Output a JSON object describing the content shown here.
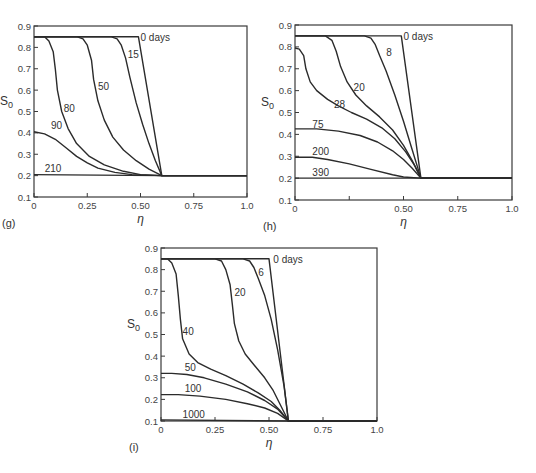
{
  "figure": {
    "panels": [
      "g",
      "h",
      "i"
    ]
  },
  "chart_data": [
    {
      "type": "line",
      "panel_label": "(g)",
      "title": "",
      "xlabel": "η",
      "ylabel": "S0",
      "xlim": [
        0,
        1.0
      ],
      "ylim": [
        0.1,
        0.9
      ],
      "x_ticks": [
        "0",
        "0.25",
        "0.50",
        "0.75",
        "1.0"
      ],
      "y_ticks": [
        "0.1",
        "0.2",
        "0.3",
        "0.4",
        "0.5",
        "0.6",
        "0.7",
        "0.8",
        "0.9"
      ],
      "grid": false,
      "legend": "inline curve labels",
      "box_px": {
        "x0": 34,
        "x1": 247,
        "y_top": 26,
        "y_bot": 197
      },
      "series": [
        {
          "name": "0 days",
          "label_at": [
            0.5,
            0.83
          ],
          "points": [
            [
              0,
              0.85
            ],
            [
              0.49,
              0.85
            ],
            [
              0.6,
              0.2
            ],
            [
              1.0,
              0.2
            ]
          ]
        },
        {
          "name": "15",
          "label_at": [
            0.44,
            0.75
          ],
          "points": [
            [
              0,
              0.85
            ],
            [
              0.36,
              0.85
            ],
            [
              0.39,
              0.84
            ],
            [
              0.41,
              0.81
            ],
            [
              0.43,
              0.75
            ],
            [
              0.45,
              0.66
            ],
            [
              0.48,
              0.54
            ],
            [
              0.51,
              0.44
            ],
            [
              0.54,
              0.35
            ],
            [
              0.57,
              0.27
            ],
            [
              0.6,
              0.2
            ],
            [
              1.0,
              0.2
            ]
          ]
        },
        {
          "name": "50",
          "label_at": [
            0.3,
            0.6
          ],
          "points": [
            [
              0,
              0.85
            ],
            [
              0.2,
              0.85
            ],
            [
              0.23,
              0.84
            ],
            [
              0.25,
              0.81
            ],
            [
              0.27,
              0.74
            ],
            [
              0.28,
              0.65
            ],
            [
              0.3,
              0.55
            ],
            [
              0.33,
              0.46
            ],
            [
              0.37,
              0.38
            ],
            [
              0.42,
              0.32
            ],
            [
              0.48,
              0.27
            ],
            [
              0.54,
              0.23
            ],
            [
              0.6,
              0.2
            ],
            [
              1.0,
              0.2
            ]
          ]
        },
        {
          "name": "80",
          "label_at": [
            0.14,
            0.5
          ],
          "points": [
            [
              0,
              0.85
            ],
            [
              0.05,
              0.85
            ],
            [
              0.07,
              0.83
            ],
            [
              0.09,
              0.78
            ],
            [
              0.1,
              0.7
            ],
            [
              0.11,
              0.6
            ],
            [
              0.13,
              0.5
            ],
            [
              0.16,
              0.42
            ],
            [
              0.2,
              0.35
            ],
            [
              0.26,
              0.29
            ],
            [
              0.33,
              0.25
            ],
            [
              0.42,
              0.22
            ],
            [
              0.5,
              0.205
            ],
            [
              0.6,
              0.2
            ],
            [
              1.0,
              0.2
            ]
          ]
        },
        {
          "name": "90",
          "label_at": [
            0.08,
            0.42
          ],
          "points": [
            [
              0,
              0.405
            ],
            [
              0.05,
              0.395
            ],
            [
              0.1,
              0.37
            ],
            [
              0.15,
              0.33
            ],
            [
              0.2,
              0.29
            ],
            [
              0.25,
              0.26
            ],
            [
              0.3,
              0.235
            ],
            [
              0.38,
              0.215
            ],
            [
              0.46,
              0.205
            ],
            [
              0.6,
              0.2
            ],
            [
              1.0,
              0.2
            ]
          ]
        },
        {
          "name": "210",
          "label_at": [
            0.05,
            0.215
          ],
          "points": [
            [
              0,
              0.205
            ],
            [
              0.6,
              0.2
            ],
            [
              1.0,
              0.2
            ]
          ]
        }
      ]
    },
    {
      "type": "line",
      "panel_label": "(h)",
      "title": "",
      "xlabel": "η",
      "ylabel": "S0",
      "xlim": [
        0,
        1.0
      ],
      "ylim": [
        0.1,
        0.9
      ],
      "x_ticks": [
        "0",
        "",
        "0.50",
        "0.75",
        "1.0"
      ],
      "y_ticks": [
        "0.1",
        "0.2",
        "0.3",
        "0.4",
        "0.5",
        "0.6",
        "0.7",
        "0.8",
        "0.9"
      ],
      "grid": false,
      "legend": "inline curve labels",
      "box_px": {
        "x0": 295,
        "x1": 512,
        "y_top": 25,
        "y_bot": 200
      },
      "series": [
        {
          "name": "0 days",
          "label_at": [
            0.5,
            0.83
          ],
          "points": [
            [
              0,
              0.85
            ],
            [
              0.49,
              0.85
            ],
            [
              0.58,
              0.2
            ],
            [
              1.0,
              0.2
            ]
          ]
        },
        {
          "name": "8",
          "label_at": [
            0.42,
            0.76
          ],
          "points": [
            [
              0,
              0.85
            ],
            [
              0.32,
              0.85
            ],
            [
              0.35,
              0.84
            ],
            [
              0.37,
              0.81
            ],
            [
              0.39,
              0.76
            ],
            [
              0.42,
              0.69
            ],
            [
              0.46,
              0.58
            ],
            [
              0.5,
              0.46
            ],
            [
              0.54,
              0.33
            ],
            [
              0.58,
              0.2
            ],
            [
              1.0,
              0.2
            ]
          ]
        },
        {
          "name": "20",
          "label_at": [
            0.27,
            0.6
          ],
          "points": [
            [
              0,
              0.85
            ],
            [
              0.14,
              0.85
            ],
            [
              0.17,
              0.83
            ],
            [
              0.19,
              0.78
            ],
            [
              0.21,
              0.71
            ],
            [
              0.24,
              0.64
            ],
            [
              0.28,
              0.58
            ],
            [
              0.33,
              0.53
            ],
            [
              0.39,
              0.48
            ],
            [
              0.45,
              0.42
            ],
            [
              0.5,
              0.35
            ],
            [
              0.54,
              0.28
            ],
            [
              0.58,
              0.2
            ],
            [
              1.0,
              0.2
            ]
          ]
        },
        {
          "name": "28",
          "label_at": [
            0.18,
            0.52
          ],
          "points": [
            [
              0,
              0.795
            ],
            [
              0.02,
              0.79
            ],
            [
              0.04,
              0.76
            ],
            [
              0.05,
              0.7
            ],
            [
              0.07,
              0.64
            ],
            [
              0.1,
              0.6
            ],
            [
              0.15,
              0.56
            ],
            [
              0.2,
              0.53
            ],
            [
              0.26,
              0.5
            ],
            [
              0.33,
              0.47
            ],
            [
              0.4,
              0.43
            ],
            [
              0.46,
              0.38
            ],
            [
              0.51,
              0.32
            ],
            [
              0.55,
              0.26
            ],
            [
              0.58,
              0.2
            ],
            [
              1.0,
              0.2
            ]
          ]
        },
        {
          "name": "75",
          "label_at": [
            0.08,
            0.43
          ],
          "points": [
            [
              0,
              0.425
            ],
            [
              0.1,
              0.425
            ],
            [
              0.2,
              0.415
            ],
            [
              0.3,
              0.395
            ],
            [
              0.38,
              0.365
            ],
            [
              0.45,
              0.325
            ],
            [
              0.5,
              0.285
            ],
            [
              0.54,
              0.245
            ],
            [
              0.58,
              0.2
            ],
            [
              1.0,
              0.2
            ]
          ]
        },
        {
          "name": "200",
          "label_at": [
            0.08,
            0.305
          ],
          "points": [
            [
              0,
              0.295
            ],
            [
              0.08,
              0.295
            ],
            [
              0.15,
              0.285
            ],
            [
              0.25,
              0.265
            ],
            [
              0.35,
              0.24
            ],
            [
              0.45,
              0.215
            ],
            [
              0.5,
              0.205
            ],
            [
              0.58,
              0.2
            ],
            [
              1.0,
              0.2
            ]
          ]
        },
        {
          "name": "390",
          "label_at": [
            0.08,
            0.21
          ],
          "points": [
            [
              0,
              0.2
            ],
            [
              0.58,
              0.2
            ],
            [
              1.0,
              0.2
            ]
          ]
        }
      ]
    },
    {
      "type": "line",
      "panel_label": "(i)",
      "title": "",
      "xlabel": "η",
      "ylabel": "S0",
      "xlim": [
        0,
        1.0
      ],
      "ylim": [
        0.1,
        0.9
      ],
      "x_ticks": [
        "0",
        "0.25",
        "0.50",
        "0.75",
        "1.0"
      ],
      "y_ticks": [
        "0.1",
        "0.2",
        "0.3",
        "0.4",
        "0.5",
        "0.6",
        "0.7",
        "0.8",
        "0.9"
      ],
      "grid": false,
      "legend": "inline curve labels",
      "box_px": {
        "x0": 161,
        "x1": 377,
        "y_top": 248,
        "y_bot": 421
      },
      "series": [
        {
          "name": "0 days",
          "label_at": [
            0.52,
            0.83
          ],
          "points": [
            [
              0,
              0.85
            ],
            [
              0.5,
              0.85
            ],
            [
              0.59,
              0.1
            ],
            [
              1.0,
              0.1
            ]
          ]
        },
        {
          "name": "6",
          "label_at": [
            0.45,
            0.77
          ],
          "points": [
            [
              0,
              0.85
            ],
            [
              0.38,
              0.85
            ],
            [
              0.41,
              0.84
            ],
            [
              0.43,
              0.81
            ],
            [
              0.45,
              0.76
            ],
            [
              0.48,
              0.68
            ],
            [
              0.51,
              0.57
            ],
            [
              0.54,
              0.43
            ],
            [
              0.57,
              0.26
            ],
            [
              0.59,
              0.1
            ],
            [
              1.0,
              0.1
            ]
          ]
        },
        {
          "name": "20",
          "label_at": [
            0.34,
            0.68
          ],
          "points": [
            [
              0,
              0.85
            ],
            [
              0.25,
              0.85
            ],
            [
              0.28,
              0.84
            ],
            [
              0.3,
              0.8
            ],
            [
              0.32,
              0.73
            ],
            [
              0.33,
              0.64
            ],
            [
              0.34,
              0.55
            ],
            [
              0.36,
              0.47
            ],
            [
              0.39,
              0.41
            ],
            [
              0.43,
              0.36
            ],
            [
              0.48,
              0.3
            ],
            [
              0.52,
              0.24
            ],
            [
              0.55,
              0.18
            ],
            [
              0.59,
              0.1
            ],
            [
              1.0,
              0.1
            ]
          ]
        },
        {
          "name": "40",
          "label_at": [
            0.1,
            0.5
          ],
          "points": [
            [
              0,
              0.85
            ],
            [
              0.03,
              0.85
            ],
            [
              0.05,
              0.83
            ],
            [
              0.07,
              0.78
            ],
            [
              0.08,
              0.68
            ],
            [
              0.09,
              0.57
            ],
            [
              0.1,
              0.48
            ],
            [
              0.13,
              0.41
            ],
            [
              0.17,
              0.37
            ],
            [
              0.23,
              0.34
            ],
            [
              0.3,
              0.31
            ],
            [
              0.38,
              0.27
            ],
            [
              0.45,
              0.23
            ],
            [
              0.51,
              0.19
            ],
            [
              0.55,
              0.15
            ],
            [
              0.59,
              0.1
            ],
            [
              1.0,
              0.1
            ]
          ]
        },
        {
          "name": "50",
          "label_at": [
            0.11,
            0.33
          ],
          "points": [
            [
              0,
              0.32
            ],
            [
              0.05,
              0.32
            ],
            [
              0.12,
              0.315
            ],
            [
              0.2,
              0.3
            ],
            [
              0.3,
              0.27
            ],
            [
              0.4,
              0.235
            ],
            [
              0.48,
              0.195
            ],
            [
              0.54,
              0.155
            ],
            [
              0.59,
              0.1
            ],
            [
              1.0,
              0.1
            ]
          ]
        },
        {
          "name": "100",
          "label_at": [
            0.11,
            0.235
          ],
          "points": [
            [
              0,
              0.222
            ],
            [
              0.08,
              0.222
            ],
            [
              0.18,
              0.215
            ],
            [
              0.3,
              0.2
            ],
            [
              0.4,
              0.18
            ],
            [
              0.48,
              0.16
            ],
            [
              0.54,
              0.135
            ],
            [
              0.59,
              0.1
            ],
            [
              1.0,
              0.1
            ]
          ]
        },
        {
          "name": "1000",
          "label_at": [
            0.1,
            0.115
          ],
          "points": [
            [
              0,
              0.105
            ],
            [
              0.59,
              0.1
            ],
            [
              1.0,
              0.1
            ]
          ]
        }
      ]
    }
  ]
}
